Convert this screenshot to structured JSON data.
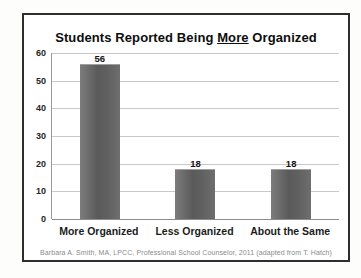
{
  "chart_data": {
    "type": "bar",
    "title_parts": [
      {
        "text": "Students Reported Being ",
        "underline": false
      },
      {
        "text": "More",
        "underline": true
      },
      {
        "text": " Organized",
        "underline": false
      }
    ],
    "title": "Students Reported Being More Organized",
    "categories": [
      "More Organized",
      "Less Organized",
      "About the Same"
    ],
    "values": [
      56,
      18,
      18
    ],
    "yticks": [
      0,
      10,
      20,
      30,
      40,
      50,
      60
    ],
    "ylim": [
      0,
      60
    ],
    "xlabel": "",
    "ylabel": "",
    "grid": true,
    "legend": false,
    "bar_color": "#636363",
    "gridline_color": "#c9c9c9",
    "caption": "Barbara A. Smith, MA, LPCC, Professional School Counselor, 2011 (adapted from T. Hatch)"
  }
}
